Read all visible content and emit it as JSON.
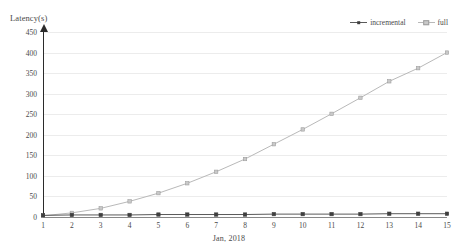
{
  "chart_data": {
    "type": "line",
    "title": "",
    "xlabel": "Jan, 2018",
    "ylabel": "Latency(s)",
    "x": [
      1,
      2,
      3,
      4,
      5,
      6,
      7,
      8,
      9,
      10,
      11,
      12,
      13,
      14,
      15
    ],
    "xtick_labels": [
      "1",
      "2",
      "3",
      "4",
      "5",
      "6",
      "7",
      "8",
      "9",
      "10",
      "11",
      "12",
      "13",
      "14",
      "15"
    ],
    "ytick_labels": [
      "0",
      "50",
      "100",
      "150",
      "200",
      "250",
      "300",
      "350",
      "400",
      "450"
    ],
    "ytick_values": [
      0,
      50,
      100,
      150,
      200,
      250,
      300,
      350,
      400,
      450
    ],
    "ylim": [
      0,
      450
    ],
    "xlim": [
      1,
      15
    ],
    "grid": true,
    "legend_position": "top-right",
    "series": [
      {
        "name": "incremental",
        "color": "#5a5a5a",
        "marker": "square",
        "values": [
          4,
          5,
          5,
          5,
          6,
          6,
          6,
          6,
          7,
          7,
          7,
          7,
          8,
          8,
          8
        ]
      },
      {
        "name": "full",
        "color": "#b9b9b9",
        "marker": "square",
        "values": [
          3,
          10,
          21,
          38,
          58,
          82,
          110,
          141,
          177,
          213,
          251,
          290,
          330,
          362,
          400
        ]
      }
    ]
  },
  "axis": {
    "y_title": "Latency(s)",
    "x_title": "Jan, 2018"
  },
  "legend": {
    "items": [
      {
        "label": "incremental"
      },
      {
        "label": "full"
      }
    ]
  },
  "colors": {
    "incremental": "#5a5a5a",
    "full": "#b9b9b9",
    "grid": "#ececec",
    "axis": "#2b2b2b",
    "text": "#4a4a4a"
  }
}
